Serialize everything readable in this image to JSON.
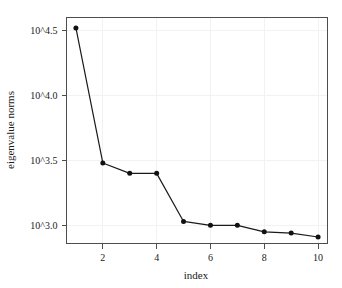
{
  "chart_data": {
    "type": "line",
    "title": "",
    "xlabel": "index",
    "ylabel": "eigenvalue norms",
    "x": [
      1,
      2,
      3,
      4,
      5,
      6,
      7,
      8,
      9,
      10
    ],
    "values": [
      4.52,
      3.48,
      3.4,
      3.4,
      3.03,
      3.0,
      3.0,
      2.95,
      2.94,
      2.91
    ],
    "value_scale": "log10",
    "series": [
      {
        "name": "eigenvalue norms",
        "values": [
          4.52,
          3.48,
          3.4,
          3.4,
          3.03,
          3.0,
          3.0,
          2.95,
          2.94,
          2.91
        ]
      }
    ],
    "xlim": [
      0.65,
      10.35
    ],
    "ylim": [
      2.86,
      4.6
    ],
    "xticks": [
      2,
      4,
      6,
      8,
      10
    ],
    "xtick_labels": [
      "2",
      "4",
      "6",
      "8",
      "10"
    ],
    "yticks": [
      3.0,
      3.5,
      4.0,
      4.5
    ],
    "ytick_labels": [
      "10^3.0",
      "10^3.5",
      "10^4.0",
      "10^4.5"
    ],
    "grid": true,
    "grid_color": "#f2f2f2",
    "legend": null,
    "legend_position": "none",
    "marker": "filled-circle",
    "line_color": "#1a1a1a",
    "marker_color": "#111111",
    "background_color": "#ffffff",
    "frame_color": "#4d4d4d"
  },
  "axes": {
    "x_title": "index",
    "y_title": "eigenvalue norms",
    "x_tick_labels": [
      "2",
      "4",
      "6",
      "8",
      "10"
    ],
    "y_tick_labels": [
      "10^3.0",
      "10^3.5",
      "10^4.0",
      "10^4.5"
    ]
  }
}
